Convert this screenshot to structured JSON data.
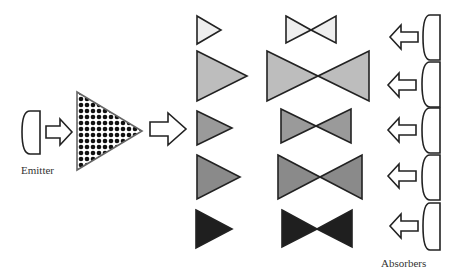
{
  "labels": {
    "emitter": "Emitter",
    "absorbers": "Absorbers"
  },
  "colors": {
    "stroke": "#222222",
    "level_1": "#eeeeee",
    "level_2": "#bdbdbd",
    "level_3": "#9a9a9a",
    "level_4": "#8a8a8a",
    "level_5": "#1f1f1f"
  },
  "rows": [
    {
      "triangle": "small, light",
      "bowtie": "small, light"
    },
    {
      "triangle": "large, light gray",
      "bowtie": "large, light gray"
    },
    {
      "triangle": "medium, gray",
      "bowtie": "medium, gray"
    },
    {
      "triangle": "large, gray",
      "bowtie": "large, gray"
    },
    {
      "triangle": "medium, black",
      "bowtie": "medium, black"
    }
  ]
}
